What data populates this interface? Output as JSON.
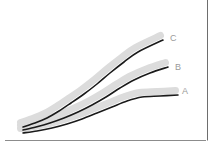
{
  "figure": {
    "title": "",
    "background_color": "#ffffff",
    "width": 222,
    "height": 147,
    "frame": {
      "right_rule_color": "#6e6e6e",
      "bottom_rule_color": "#8c8c8c"
    }
  },
  "chart_data": {
    "type": "line",
    "title": "",
    "xlabel": "",
    "ylabel": "",
    "grid": false,
    "legend_position": "inline-right-end-labels",
    "axis_style": "right-vertical-rule-and-bottom-baseline-only",
    "xlim": [
      0,
      100
    ],
    "ylim": [
      0,
      100
    ],
    "line_color": "#1a1a1a",
    "shadow_color": "#dcdcdc",
    "line_width_px": 1.6,
    "shadow_width_px": 7,
    "shadow_offset_px": {
      "x": -2.5,
      "y": -4.5
    },
    "series": [
      {
        "name": "A",
        "label": "A",
        "label_x": 182,
        "label_y": 92,
        "x": [
          0,
          10,
          20,
          30,
          40,
          50,
          60,
          70,
          80,
          90,
          100
        ],
        "y": [
          4,
          6,
          9,
          13,
          18,
          24,
          31,
          39,
          48,
          58,
          69
        ],
        "points_px": [
          [
            23,
            133
          ],
          [
            37,
            131
          ],
          [
            52,
            128
          ],
          [
            67,
            124
          ],
          [
            82,
            119
          ],
          [
            97,
            113
          ],
          [
            112,
            107
          ],
          [
            127,
            101
          ],
          [
            142,
            97
          ],
          [
            160,
            96
          ],
          [
            178,
            95
          ]
        ]
      },
      {
        "name": "B",
        "label": "B",
        "label_x": 175,
        "label_y": 68,
        "x": [
          0,
          10,
          20,
          30,
          40,
          50,
          60,
          70,
          80,
          90,
          100
        ],
        "y": [
          4,
          7,
          12,
          18,
          25,
          34,
          44,
          55,
          67,
          80,
          93
        ],
        "points_px": [
          [
            23,
            130
          ],
          [
            36,
            127
          ],
          [
            50,
            123
          ],
          [
            64,
            118
          ],
          [
            78,
            112
          ],
          [
            92,
            105
          ],
          [
            106,
            97
          ],
          [
            120,
            88
          ],
          [
            134,
            80
          ],
          [
            150,
            73
          ],
          [
            168,
            67
          ]
        ]
      },
      {
        "name": "C",
        "label": "C",
        "label_x": 170,
        "label_y": 39,
        "x": [
          0,
          10,
          20,
          30,
          40,
          50,
          60,
          70,
          80,
          90,
          100
        ],
        "y": [
          4,
          9,
          16,
          25,
          36,
          48,
          61,
          74,
          87,
          99,
          110
        ],
        "points_px": [
          [
            23,
            127
          ],
          [
            35,
            123
          ],
          [
            47,
            118
          ],
          [
            59,
            111
          ],
          [
            71,
            103
          ],
          [
            84,
            94
          ],
          [
            97,
            84
          ],
          [
            110,
            73
          ],
          [
            124,
            62
          ],
          [
            138,
            52
          ],
          [
            163,
            40
          ]
        ]
      }
    ]
  }
}
